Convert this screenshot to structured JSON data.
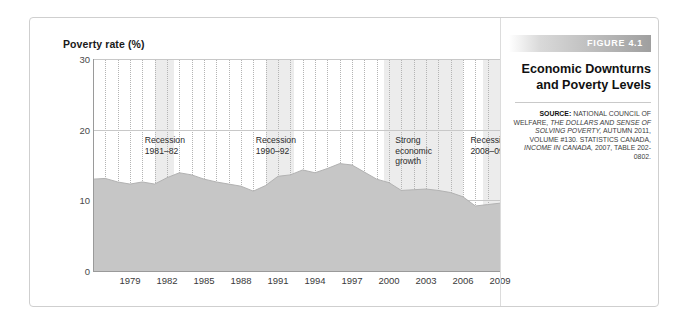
{
  "figure": {
    "tag": "FIGURE 4.1",
    "title_line1": "Economic Downturns",
    "title_line2": "and Poverty Levels",
    "source_label": "SOURCE:",
    "source_text_1": " NATIONAL COUNCIL OF WELFARE, ",
    "source_italic_1": "THE DOLLARS AND SENSE OF SOLVING POVERTY,",
    "source_text_2": " AUTUMN 2011, VOLUME #130. STATISTICS CANADA, ",
    "source_italic_2": "INCOME IN CANADA,",
    "source_text_3": " 2007, TABLE 202-0802."
  },
  "colors": {
    "area_fill": "#c6c6c6",
    "band_light": "#ececec",
    "band_base": "#ffffff",
    "axis": "#9a9a9a",
    "grid": "#c8c8c8",
    "text": "#1a1a1a",
    "tag_text": "#ffffff"
  },
  "chart_data": {
    "type": "area",
    "title": "Poverty rate (%)",
    "xlabel": "",
    "ylabel": "Poverty rate (%)",
    "ylim": [
      0,
      30
    ],
    "xlim": [
      1976,
      2009
    ],
    "yticks": [
      0,
      10,
      20,
      30
    ],
    "xticks": [
      1979,
      1982,
      1985,
      1988,
      1991,
      1994,
      1997,
      2000,
      2003,
      2006,
      2009
    ],
    "grid": "vertical-dotted-and-horizontal",
    "legend": "none",
    "x": [
      1976,
      1977,
      1978,
      1979,
      1980,
      1981,
      1982,
      1983,
      1984,
      1985,
      1986,
      1987,
      1988,
      1989,
      1990,
      1991,
      1992,
      1993,
      1994,
      1995,
      1996,
      1997,
      1998,
      1999,
      2000,
      2001,
      2002,
      2003,
      2004,
      2005,
      2006,
      2007,
      2008,
      2009
    ],
    "values": [
      13.0,
      13.1,
      12.6,
      12.3,
      12.6,
      12.3,
      13.2,
      13.9,
      13.6,
      13.0,
      12.6,
      12.3,
      12.0,
      11.3,
      12.1,
      13.4,
      13.6,
      14.3,
      13.9,
      14.5,
      15.2,
      15.0,
      14.0,
      13.0,
      12.5,
      11.4,
      11.5,
      11.6,
      11.4,
      11.1,
      10.5,
      9.2,
      9.4,
      9.6
    ],
    "series": [
      {
        "name": "Poverty rate (%)",
        "values": [
          13.0,
          13.1,
          12.6,
          12.3,
          12.6,
          12.3,
          13.2,
          13.9,
          13.6,
          13.0,
          12.6,
          12.3,
          12.0,
          11.3,
          12.1,
          13.4,
          13.6,
          14.3,
          13.9,
          14.5,
          15.2,
          15.0,
          14.0,
          13.0,
          12.5,
          11.4,
          11.5,
          11.6,
          11.4,
          11.1,
          10.5,
          9.2,
          9.4,
          9.6
        ]
      }
    ],
    "bands": [
      {
        "id": "recession-1981-82",
        "label_line1": "Recession",
        "label_line2": "1981–82",
        "start": 1981.0,
        "end": 1982.6,
        "shade": "light"
      },
      {
        "id": "recession-1990-92",
        "label_line1": "Recession",
        "label_line2": "1990–92",
        "start": 1990.0,
        "end": 1992.3,
        "shade": "light"
      },
      {
        "id": "strong-economic-growth",
        "label_line1": "Strong",
        "label_line2": "economic",
        "label_line3": "growth",
        "start": 1999.6,
        "end": 2006.0,
        "shade": "light"
      },
      {
        "id": "recession-2008-09",
        "label_line1": "Recession",
        "label_line2": "2008–09",
        "start": 2007.6,
        "end": 2009.0,
        "shade": "light"
      }
    ],
    "annotations": [
      {
        "id": "ann-recession-1981",
        "lines": [
          "Recession",
          "1981–82"
        ],
        "x": 1980.2,
        "y": 19.2
      },
      {
        "id": "ann-recession-1990",
        "lines": [
          "Recession",
          "1990–92"
        ],
        "x": 1989.2,
        "y": 19.2
      },
      {
        "id": "ann-strong-growth",
        "lines": [
          "Strong",
          "economic",
          "growth"
        ],
        "x": 2000.5,
        "y": 19.2
      },
      {
        "id": "ann-recession-2008",
        "lines": [
          "Recession",
          "2008–09"
        ],
        "x": 2006.6,
        "y": 19.2
      }
    ]
  }
}
